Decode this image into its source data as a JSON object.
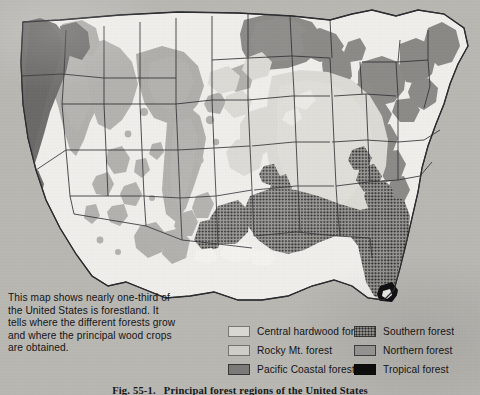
{
  "figure": {
    "caption_number": "Fig. 55-1.",
    "caption_text": "Principal forest regions of the United States"
  },
  "description": {
    "lines": [
      "This map shows nearly one-third of",
      "the United States is forestland. It",
      "tells where the different forests grow",
      "and where the principal wood crops",
      "are obtained."
    ]
  },
  "legend": {
    "left_column": [
      {
        "label": "Central hardwood forest",
        "swatch": "central-hardwood-swatch",
        "color": "#d9d7d2"
      },
      {
        "label": "Rocky Mt. forest",
        "swatch": "rocky-mountain-swatch",
        "color": "#cfcdc8"
      },
      {
        "label": "Pacific Coastal forest",
        "swatch": "pacific-coastal-swatch",
        "color": "#7b7a78"
      }
    ],
    "right_column": [
      {
        "label": "Southern forest",
        "swatch": "southern-swatch",
        "color": "#8d8b88"
      },
      {
        "label": "Northern forest",
        "swatch": "northern-swatch",
        "color": "#949290"
      },
      {
        "label": "Tropical forest",
        "swatch": "tropical-swatch",
        "color": "#0d0d0e"
      }
    ]
  },
  "map": {
    "title": "Principal forest regions of the United States",
    "paper_color": "#b9b7b2",
    "land_color": "#efeeea",
    "regions": [
      {
        "name": "Pacific Coastal forest",
        "color": "#6f6e6c",
        "areas": "Pacific Northwest coast, northern California coast"
      },
      {
        "name": "Rocky Mt. forest",
        "color": "#b2b0ac",
        "areas": "Rocky Mountains, Great Basin ranges, Southwest highlands"
      },
      {
        "name": "Northern forest",
        "color": "#8c8a87",
        "areas": "Great Lakes states, New England, New York, northern Appalachians"
      },
      {
        "name": "Central hardwood forest",
        "color": "#dcdad5",
        "areas": "Ohio and Mississippi valleys, central Appalachians"
      },
      {
        "name": "Southern forest",
        "color": "#8f8d8a",
        "areas": "Gulf and South Atlantic coastal plain, east Texas"
      },
      {
        "name": "Tropical forest",
        "color": "#101012",
        "areas": "Southern tip of Florida"
      }
    ]
  }
}
